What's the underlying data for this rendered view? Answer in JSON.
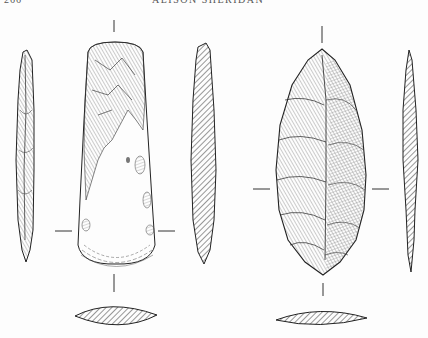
{
  "page": {
    "page_number": "266",
    "running_head": "ALISON SHERIDAN"
  },
  "figure": {
    "objects": [
      {
        "name": "polished flint axehead",
        "views": [
          "side profile (left)",
          "face view",
          "longitudinal section (hatched)",
          "transverse section (hatched, below)"
        ]
      },
      {
        "name": "flaked leaf-shaped blade",
        "views": [
          "face view",
          "longitudinal section (hatched, right)",
          "transverse section (hatched, below)"
        ]
      }
    ],
    "colors": {
      "ink": "#222222",
      "paper": "#fdfdfd",
      "hatch": "#333333"
    }
  }
}
